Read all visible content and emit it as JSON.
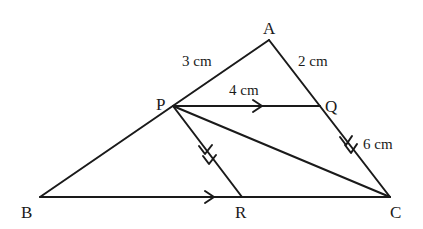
{
  "figure": {
    "type": "geometry-diagram",
    "points": {
      "A": {
        "label": "A",
        "x": 269,
        "y": 40
      },
      "P": {
        "label": "P",
        "x": 173,
        "y": 106
      },
      "Q": {
        "label": "Q",
        "x": 320,
        "y": 106
      },
      "B": {
        "label": "B",
        "x": 40,
        "y": 197
      },
      "R": {
        "label": "R",
        "x": 242,
        "y": 197
      },
      "C": {
        "label": "C",
        "x": 390,
        "y": 197
      }
    },
    "segments": [
      "AB",
      "AC",
      "PQ",
      "BC",
      "PR",
      "PC"
    ],
    "parallel_marks": {
      "single_arrow": [
        "PQ",
        "BC"
      ],
      "double_arrow": [
        "PR",
        "QC"
      ]
    },
    "measurements": {
      "AP": "3 cm",
      "AQ": "2 cm",
      "PQ": "4 cm",
      "QC": "6 cm"
    }
  }
}
